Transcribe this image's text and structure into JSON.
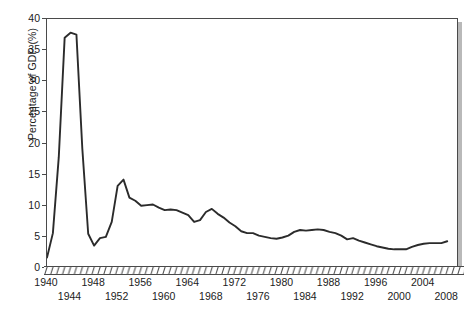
{
  "chart_data": {
    "type": "line",
    "title": "",
    "xlabel": "",
    "ylabel": "Percentage of GDP (%)",
    "xlim": [
      1940,
      2010
    ],
    "ylim": [
      0,
      40
    ],
    "grid": false,
    "legend": "none",
    "line_color": "#2b2b2b",
    "background_color": "#ffffff",
    "frame_color": "#4a4a4a",
    "shadow_color": "#b9b9b9",
    "y_ticks": [
      0,
      5,
      10,
      15,
      20,
      25,
      30,
      35,
      40
    ],
    "y_tick_labels": [
      "0",
      "5",
      "10",
      "15",
      "20",
      "25",
      "30",
      "35",
      "40"
    ],
    "x_ticks": [
      1940,
      1944,
      1948,
      1952,
      1956,
      1960,
      1964,
      1968,
      1972,
      1976,
      1980,
      1984,
      1988,
      1992,
      1996,
      2000,
      2004,
      2008
    ],
    "x_tick_labels": [
      "1940",
      "1944",
      "1948",
      "1952",
      "1956",
      "1960",
      "1964",
      "1968",
      "1972",
      "1976",
      "1980",
      "1984",
      "1988",
      "1992",
      "1996",
      "2000",
      "2004",
      "2008"
    ],
    "x_minor_tick_interval": 1,
    "x": [
      1940,
      1941,
      1942,
      1943,
      1944,
      1945,
      1946,
      1947,
      1948,
      1949,
      1950,
      1951,
      1952,
      1953,
      1954,
      1955,
      1956,
      1957,
      1958,
      1959,
      1960,
      1961,
      1962,
      1963,
      1964,
      1965,
      1966,
      1967,
      1968,
      1969,
      1970,
      1971,
      1972,
      1973,
      1974,
      1975,
      1976,
      1977,
      1978,
      1979,
      1980,
      1981,
      1982,
      1983,
      1984,
      1985,
      1986,
      1987,
      1988,
      1989,
      1990,
      1991,
      1992,
      1993,
      1994,
      1995,
      1996,
      1997,
      1998,
      1999,
      2000,
      2001,
      2002,
      2003,
      2004,
      2005,
      2006,
      2007,
      2008
    ],
    "y": [
      1.7,
      5.6,
      17.8,
      37.0,
      37.8,
      37.5,
      19.2,
      5.5,
      3.6,
      4.8,
      5.0,
      7.4,
      13.2,
      14.2,
      11.3,
      10.8,
      10.0,
      10.1,
      10.2,
      9.7,
      9.3,
      9.4,
      9.3,
      8.9,
      8.5,
      7.4,
      7.7,
      9.0,
      9.5,
      8.7,
      8.1,
      7.3,
      6.7,
      5.9,
      5.6,
      5.6,
      5.2,
      5.0,
      4.8,
      4.7,
      4.9,
      5.2,
      5.8,
      6.1,
      6.0,
      6.1,
      6.2,
      6.1,
      5.8,
      5.6,
      5.2,
      4.6,
      4.8,
      4.4,
      4.1,
      3.8,
      3.5,
      3.3,
      3.1,
      3.0,
      3.0,
      3.0,
      3.4,
      3.7,
      3.9,
      4.0,
      4.0,
      4.0,
      4.3
    ],
    "notes": {
      "peak_value": 37.8,
      "peak_year": 1944,
      "korea_peak_value": 14.2,
      "korea_peak_year": 1953,
      "vietnam_peak_value": 9.5,
      "vietnam_peak_year": 1968,
      "minimum_value": 3.0,
      "minimum_year": 2000
    }
  }
}
